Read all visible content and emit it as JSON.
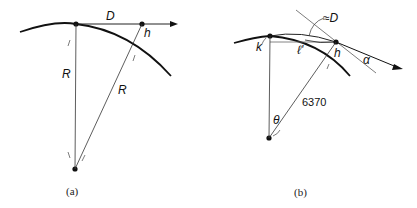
{
  "figure_a": {
    "caption": "(a)",
    "labels": {
      "distance": "D",
      "height": "h",
      "radius_left": "R",
      "radius_right": "R"
    }
  },
  "figure_b": {
    "caption": "(b)",
    "labels": {
      "approx_distance": "≈D",
      "point_k": "k",
      "chord": "ℓ'",
      "height": "h",
      "angle_alpha": "α",
      "earth_radius": "6370",
      "angle_theta": "θ"
    }
  },
  "colors": {
    "ink": "#111111",
    "thin_line": "#555555"
  }
}
